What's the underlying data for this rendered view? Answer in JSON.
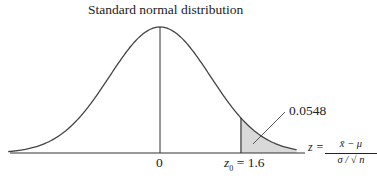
{
  "title": "Standard normal distribution",
  "chart_data": {
    "type": "area",
    "title": "Standard normal distribution",
    "distribution": "standard normal",
    "mean": 0,
    "sd": 1,
    "x_range": [
      -3,
      2.7
    ],
    "shaded_region": {
      "from": 1.6,
      "to": "+inf",
      "area": 0.0548
    },
    "tick_labels": [
      "0",
      "z0 = 1.6"
    ],
    "annotation": "0.0548",
    "xlabel": "z = (x̄ − μ) / (σ/√n)"
  },
  "labels": {
    "zero": "0",
    "z0_prefix": "z",
    "z0_sub": "0",
    "z0_value": " = 1.6",
    "area": "0.0548",
    "axis_lhs": "z =",
    "axis_num": "x̄ − μ",
    "axis_den": "σ / √ n"
  },
  "colors": {
    "shade": "#d9d9d9",
    "line": "#333333"
  }
}
